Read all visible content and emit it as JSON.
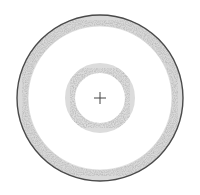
{
  "diagram": {
    "type": "concentric-rings",
    "center": {
      "x": 100,
      "y": 98
    },
    "outer_ring": {
      "outer_radius": 83,
      "band_width": 11,
      "border_color": "#4a4a4a",
      "fill_color": "#b8b8b8"
    },
    "inner_ring": {
      "outer_radius": 35,
      "band_width": 10,
      "fill_color": "#b8b8b8"
    },
    "center_mark": {
      "symbol": "+",
      "arm_length": 6,
      "color": "#444444"
    },
    "caption": ""
  },
  "colors": {
    "background": "#ffffff",
    "ring_speckle": "#9a9a9a",
    "ring_border": "#4a4a4a",
    "crosshair": "#444444"
  }
}
